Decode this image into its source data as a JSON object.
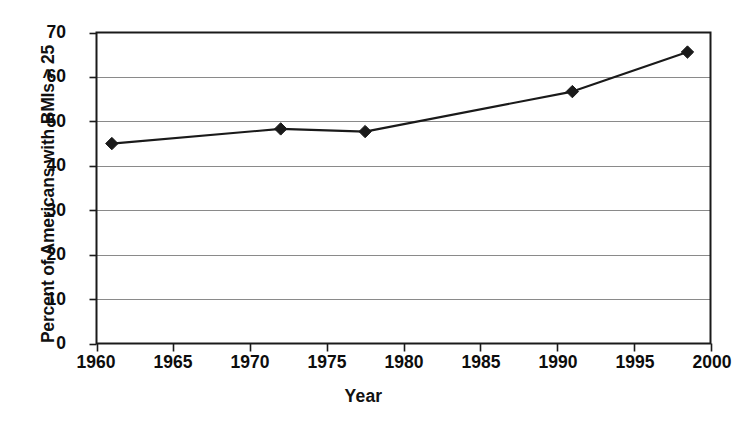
{
  "chart_data": {
    "type": "line",
    "title": "",
    "subtitle": "",
    "xlabel": "Year",
    "ylabel": "Percent of Americans with BMIs > 25",
    "xlim": [
      1960,
      2000
    ],
    "ylim": [
      0,
      70
    ],
    "xticks": [
      1960,
      1965,
      1970,
      1975,
      1980,
      1985,
      1990,
      1995,
      2000
    ],
    "yticks": [
      0,
      10,
      20,
      30,
      40,
      50,
      60,
      70
    ],
    "xtick_labels": [
      "1960",
      "1965",
      "1970",
      "1975",
      "1980",
      "1985",
      "1990",
      "1995",
      "2000"
    ],
    "ytick_labels": [
      "0",
      "10",
      "20",
      "30",
      "40",
      "50",
      "60",
      "70"
    ],
    "grid": {
      "horizontal": true,
      "vertical": false
    },
    "legend": {
      "visible": false,
      "position": "none"
    },
    "marker": "diamond",
    "marker_color": "#1a1a1a",
    "line_color": "#1a1a1a",
    "series": [
      {
        "name": "Percent of Americans with BMIs > 25",
        "x": [
          1961,
          1972,
          1977.5,
          1991,
          1998.5
        ],
        "values": [
          45.0,
          48.3,
          47.7,
          56.7,
          65.6
        ]
      }
    ],
    "annotations": []
  },
  "axes": {
    "y_title": "Percent of Americans with BMIs > 25",
    "x_title": "Year"
  },
  "colors": {
    "background": "#ffffff",
    "plot_border": "#1a1a1a",
    "gridline": "#8a8a8a",
    "data": "#1a1a1a",
    "text": "#0d0d0d"
  }
}
